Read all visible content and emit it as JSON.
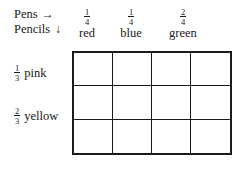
{
  "axis": {
    "pens_label": "Pens",
    "pens_arrow": "→",
    "pencils_label": "Pencils",
    "pencils_arrow": "↓"
  },
  "columns": [
    {
      "numerator": "1",
      "denominator": "4",
      "color": "red"
    },
    {
      "numerator": "1",
      "denominator": "4",
      "color": "blue"
    },
    {
      "numerator": "2",
      "denominator": "4",
      "color": "green"
    }
  ],
  "rows": [
    {
      "numerator": "1",
      "denominator": "3",
      "color": "pink"
    },
    {
      "numerator": "2",
      "denominator": "3",
      "color": "yellow"
    }
  ],
  "grid": {
    "columns": 4,
    "rows": 3,
    "cells": [
      {
        "value": ""
      },
      {
        "value": ""
      },
      {
        "value": ""
      },
      {
        "value": ""
      },
      {
        "value": ""
      },
      {
        "value": ""
      },
      {
        "value": ""
      },
      {
        "value": ""
      },
      {
        "value": ""
      },
      {
        "value": ""
      },
      {
        "value": ""
      },
      {
        "value": ""
      }
    ]
  },
  "style": {
    "ink": "#1a1a1a",
    "paper": "#ffffff"
  }
}
